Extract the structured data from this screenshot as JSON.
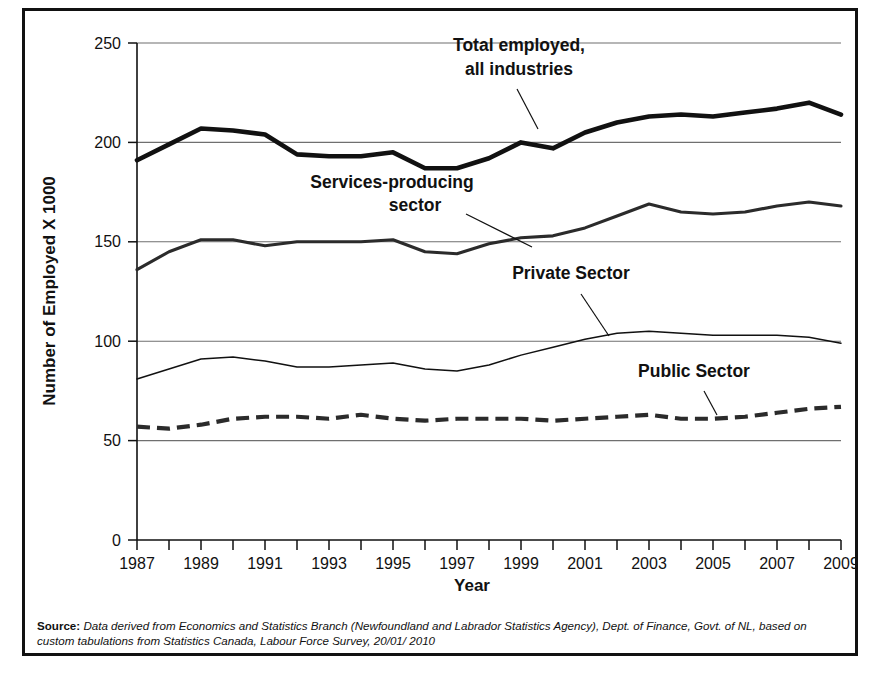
{
  "figure": {
    "source_label": "Source:",
    "source_text": "Data derived from Economics and Statistics Branch (Newfoundland and Labrador Statistics Agency), Dept. of Finance, Govt. of NL, based on custom tabulations from Statistics Canada, Labour Force Survey, 20/01/ 2010"
  },
  "chart_data": {
    "type": "line",
    "title": "",
    "xlabel": "Year",
    "ylabel": "Number of Employed X 1000",
    "xlim": [
      1987,
      2009
    ],
    "ylim": [
      0,
      250
    ],
    "yticks": [
      0,
      50,
      100,
      150,
      200,
      250
    ],
    "ytick_labels": [
      "0",
      "50",
      "100",
      "150",
      "200",
      "250"
    ],
    "xticks": [
      1987,
      1988,
      1989,
      1990,
      1991,
      1992,
      1993,
      1994,
      1995,
      1996,
      1997,
      1998,
      1999,
      2000,
      2001,
      2002,
      2003,
      2004,
      2005,
      2006,
      2007,
      2008,
      2009
    ],
    "xtick_labels": [
      "1987",
      "",
      "1989",
      "",
      "1991",
      "",
      "1993",
      "",
      "1995",
      "",
      "1997",
      "",
      "1999",
      "",
      "2001",
      "",
      "2003",
      "",
      "2005",
      "",
      "2007",
      "",
      "2009"
    ],
    "grid": true,
    "legend_position": "inline-annotations",
    "x": [
      1987,
      1988,
      1989,
      1990,
      1991,
      1992,
      1993,
      1994,
      1995,
      1996,
      1997,
      1998,
      1999,
      2000,
      2001,
      2002,
      2003,
      2004,
      2005,
      2006,
      2007,
      2008,
      2009
    ],
    "series": [
      {
        "name": "Total employed, all industries",
        "style": "thick-solid",
        "values": [
          191,
          199,
          207,
          206,
          204,
          194,
          193,
          193,
          195,
          187,
          187,
          192,
          200,
          197,
          205,
          210,
          213,
          214,
          213,
          215,
          217,
          220,
          214
        ]
      },
      {
        "name": "Services-producing sector",
        "style": "medium-solid",
        "values": [
          136,
          145,
          151,
          151,
          148,
          150,
          150,
          150,
          151,
          145,
          144,
          149,
          152,
          153,
          157,
          163,
          169,
          165,
          164,
          165,
          168,
          170,
          168
        ]
      },
      {
        "name": "Private Sector",
        "style": "thin-solid",
        "values": [
          81,
          86,
          91,
          92,
          90,
          87,
          87,
          88,
          89,
          86,
          85,
          88,
          93,
          97,
          101,
          104,
          105,
          104,
          103,
          103,
          103,
          102,
          99
        ]
      },
      {
        "name": "Public Sector",
        "style": "thick-dashed",
        "values": [
          57,
          56,
          58,
          61,
          62,
          62,
          61,
          63,
          61,
          60,
          61,
          61,
          61,
          60,
          61,
          62,
          63,
          61,
          61,
          62,
          64,
          66,
          67
        ]
      }
    ],
    "annotations": [
      {
        "text_line1": "Total employed,",
        "text_line2": "all industries"
      },
      {
        "text_line1": "Services-producing",
        "text_line2": "sector"
      },
      {
        "text_line1": "Private Sector",
        "text_line2": ""
      },
      {
        "text_line1": "Public Sector",
        "text_line2": ""
      }
    ]
  }
}
